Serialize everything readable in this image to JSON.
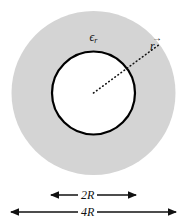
{
  "figure": {
    "type": "diagram",
    "caption_labels": {
      "permittivity_symbol": "ϵ",
      "permittivity_subscript": "r",
      "radius_vector_symbol": "r",
      "radius_vector_arrow": "→",
      "inner_dimension": "2R",
      "outer_dimension": "4R"
    },
    "colors": {
      "background": "#ffffff",
      "annulus_fill": "#d4d4d4",
      "inner_fill": "#ffffff",
      "stroke": "#000000",
      "text": "#111111"
    },
    "geometry": {
      "center_x": 93.5,
      "center_y": 93,
      "outer_radius": 82,
      "inner_radius": 41.5,
      "inner_stroke_width": 2.2,
      "vector_tip_x": 163,
      "vector_tip_y": 43
    },
    "dimensions": [
      {
        "name": "inner-diameter",
        "label": "2R",
        "x_start": 50,
        "x_end": 137,
        "y": 195
      },
      {
        "name": "outer-diameter",
        "label": "4R",
        "x_start": 10,
        "x_end": 177,
        "y": 212
      }
    ]
  }
}
